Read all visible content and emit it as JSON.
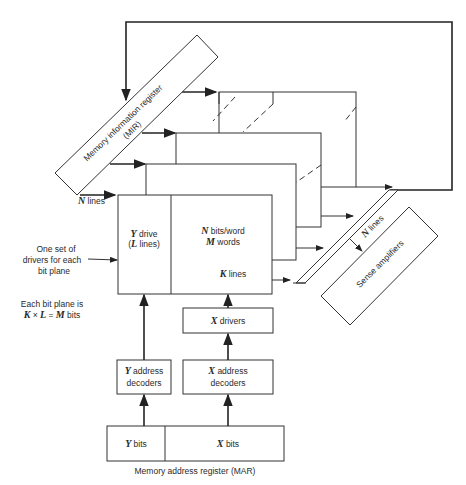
{
  "mir": {
    "line1": "Memory information register",
    "line2": "(MIR)"
  },
  "n_lines_left": {
    "var": "N",
    "text": " lines"
  },
  "y_drive": {
    "var": "Y",
    "text": " drive",
    "line2_open": "(",
    "line2_var": "L",
    "line2_text": " lines)"
  },
  "plane": {
    "line1_var": "N",
    "line1_text": " bits/word",
    "line2_var": "M",
    "line2_text": " words",
    "k_var": "K",
    "k_text": " lines"
  },
  "note_drivers": [
    "One set of",
    "drivers for each",
    "bit plane"
  ],
  "note_plane": {
    "line1": "Each bit plane is",
    "k": "K",
    "x": " × ",
    "l": "L",
    "eq": " = ",
    "m": "M",
    "bits": " bits"
  },
  "x_drivers": {
    "var": "X",
    "text": " drivers"
  },
  "y_decoders": {
    "var": "Y",
    "text": " address",
    "line2": "decoders"
  },
  "x_decoders": {
    "var": "X",
    "text": " address",
    "line2": "decoders"
  },
  "mar": {
    "y_var": "Y",
    "y_text": " bits",
    "x_var": "X",
    "x_text": " bits",
    "caption": "Memory address register (MAR)"
  },
  "sense": {
    "label": "Sense amplifiers",
    "n_var": "N",
    "n_text": " lines"
  }
}
